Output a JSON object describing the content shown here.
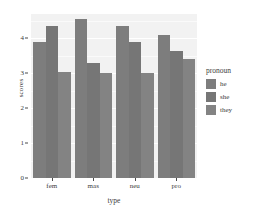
{
  "chart_data": {
    "type": "bar",
    "title": "",
    "xlabel": "type",
    "ylabel": "scores",
    "categories": [
      "fem",
      "mas",
      "neu",
      "pro"
    ],
    "series": [
      {
        "name": "he",
        "values": [
          3.9,
          4.55,
          4.35,
          4.1
        ],
        "color": "#7d7d7d"
      },
      {
        "name": "she",
        "values": [
          4.35,
          3.3,
          3.9,
          3.65
        ],
        "color": "#767676"
      },
      {
        "name": "they",
        "values": [
          3.05,
          3.0,
          3.0,
          3.4
        ],
        "color": "#838383"
      }
    ],
    "legend": {
      "title": "pronoun",
      "position": "right",
      "entries": [
        "he",
        "she",
        "they"
      ]
    },
    "ylim": [
      0,
      4.7
    ],
    "yticks": [
      0,
      1,
      2,
      3,
      4
    ],
    "ytick_labels": [
      "0",
      "1",
      "2",
      "3",
      "4"
    ],
    "grid": true,
    "panel_background": "#f2f2f2",
    "grid_color": "#ffffff",
    "figure_background": "#ffffff",
    "axis_text_color": "#3c3c3c"
  }
}
